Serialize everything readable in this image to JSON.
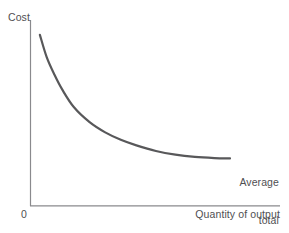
{
  "chart_data": {
    "type": "line",
    "title": "",
    "subtitle": "",
    "xlabel": "Quantity of output",
    "ylabel": "Cost",
    "origin_label": "0",
    "grid": false,
    "legend_position": "inline-right",
    "axis_ranges": {
      "x": [
        0,
        100
      ],
      "y": [
        0,
        100
      ]
    },
    "axis_ticks": {
      "x": [],
      "y": []
    },
    "annotations": [
      {
        "name": "average-total-cost-label",
        "lines": [
          "Average",
          "total",
          "cost"
        ],
        "text": "Average total cost",
        "anchor": "curve-right-end"
      }
    ],
    "series": [
      {
        "name": "Average total cost",
        "color": "#58585a",
        "line_width": 2.2,
        "points": [
          {
            "x": 2.5,
            "y": 92.0
          },
          {
            "x": 6.0,
            "y": 80.0
          },
          {
            "x": 10.0,
            "y": 70.5
          },
          {
            "x": 14.0,
            "y": 62.5
          },
          {
            "x": 20.0,
            "y": 53.0
          },
          {
            "x": 28.0,
            "y": 45.0
          },
          {
            "x": 36.0,
            "y": 39.5
          },
          {
            "x": 44.0,
            "y": 35.5
          },
          {
            "x": 52.0,
            "y": 32.5
          },
          {
            "x": 62.0,
            "y": 29.5
          },
          {
            "x": 72.0,
            "y": 27.5
          },
          {
            "x": 82.0,
            "y": 26.3
          },
          {
            "x": 92.0,
            "y": 25.7
          },
          {
            "x": 100.0,
            "y": 25.5
          }
        ]
      }
    ]
  },
  "colors": {
    "background": "#ffffff",
    "axis": "#8a8a8d",
    "curve": "#58585a",
    "text": "#4f4f52"
  },
  "labels": {
    "y_axis": "Cost",
    "x_axis": "Quantity of output",
    "origin": "0",
    "curve_line1": "Average",
    "curve_line2": "total",
    "curve_line3": "cost"
  }
}
